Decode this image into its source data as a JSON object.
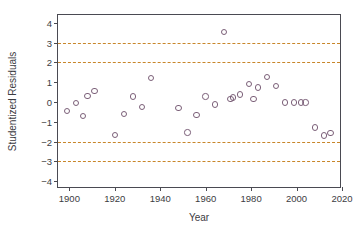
{
  "chart_data": {
    "type": "scatter",
    "title": "",
    "xlabel": "Year",
    "ylabel": "Studentized Residuals",
    "xlim": [
      1895,
      2020
    ],
    "ylim": [
      -4.4,
      4.4
    ],
    "xticks": [
      1900,
      1920,
      1940,
      1960,
      1980,
      2000,
      2020
    ],
    "yticks": [
      4,
      3,
      2,
      1,
      0,
      -1,
      -2,
      -3,
      -4
    ],
    "grid": false,
    "legend": null,
    "marker": "open-circle",
    "marker_color": "#7b5f78",
    "threshold_color": "#c8862a",
    "threshold_lines": [
      3,
      2,
      -2,
      -3
    ],
    "series": [
      {
        "name": "Studentized Residuals",
        "x": [
          1899,
          1903,
          1906,
          1908,
          1911,
          1920,
          1924,
          1928,
          1932,
          1936,
          1948,
          1952,
          1956,
          1960,
          1964,
          1971,
          1972,
          1975,
          1979,
          1981,
          1983,
          1987,
          1991,
          1995,
          1999,
          2002,
          2004,
          2008,
          2012,
          2015,
          1968
        ],
        "y": [
          -0.47,
          -0.06,
          -0.71,
          0.3,
          0.56,
          -1.68,
          -0.6,
          0.28,
          -0.24,
          1.21,
          -0.29,
          -1.54,
          -0.65,
          0.28,
          -0.13,
          0.14,
          0.22,
          0.38,
          0.9,
          0.16,
          0.74,
          1.26,
          0.8,
          -0.02,
          -0.02,
          -0.02,
          -0.02,
          -1.28,
          -1.7,
          -1.58,
          3.55
        ]
      }
    ]
  },
  "axes": {
    "ytick_labels": [
      "4",
      "3",
      "2",
      "1",
      "0",
      "−1",
      "−2",
      "−3",
      "−4"
    ],
    "xtick_labels": [
      "1900",
      "1920",
      "1940",
      "1960",
      "1980",
      "2000",
      "2020"
    ]
  }
}
